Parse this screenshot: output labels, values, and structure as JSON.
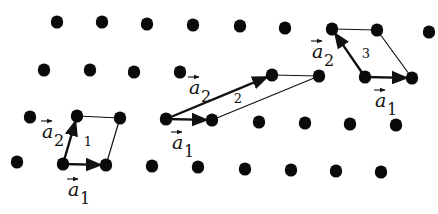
{
  "diagram": {
    "colors": {
      "dot": "#0a0a0a",
      "line": "#111111",
      "background": "#ffffff"
    },
    "lattice_points": [
      [
        57,
        22
      ],
      [
        102,
        22
      ],
      [
        147,
        24
      ],
      [
        193,
        25
      ],
      [
        240,
        26
      ],
      [
        285,
        28
      ],
      [
        332,
        29
      ],
      [
        377,
        30
      ],
      [
        429,
        32
      ],
      [
        44,
        70
      ],
      [
        90,
        70
      ],
      [
        134,
        72
      ],
      [
        180,
        72
      ],
      [
        272,
        75
      ],
      [
        319,
        76
      ],
      [
        365,
        77
      ],
      [
        412,
        78
      ],
      [
        30,
        117
      ],
      [
        77,
        116
      ],
      [
        120,
        118
      ],
      [
        166,
        119
      ],
      [
        212,
        120
      ],
      [
        259,
        122
      ],
      [
        305,
        123
      ],
      [
        350,
        124
      ],
      [
        396,
        125
      ],
      [
        17,
        162
      ],
      [
        63,
        164
      ],
      [
        106,
        165
      ],
      [
        152,
        166
      ],
      [
        198,
        167
      ],
      [
        245,
        169
      ],
      [
        291,
        170
      ],
      [
        336,
        171
      ],
      [
        381,
        172
      ]
    ],
    "cells": [
      {
        "id": "1",
        "label": "1",
        "origin": [
          63,
          164
        ],
        "a1_tip": [
          106,
          165
        ],
        "a2_tip": [
          77,
          116
        ],
        "far": [
          120,
          118
        ],
        "label_pos": [
          88,
          146
        ],
        "a1_label": {
          "text": "a",
          "sub": "1",
          "pos": [
            68,
            196
          ]
        },
        "a2_label": {
          "text": "a",
          "sub": "2",
          "pos": [
            42,
            138
          ]
        }
      },
      {
        "id": "2",
        "label": "2",
        "origin": [
          166,
          119
        ],
        "a1_tip": [
          212,
          120
        ],
        "a2_tip": [
          272,
          75
        ],
        "far": [
          319,
          76
        ],
        "label_pos": [
          238,
          103
        ],
        "a1_label": {
          "text": "a",
          "sub": "1",
          "pos": [
            172,
            149
          ]
        },
        "a2_label": {
          "text": "a",
          "sub": "2",
          "pos": [
            189,
            94
          ]
        }
      },
      {
        "id": "3",
        "label": "3",
        "origin": [
          365,
          77
        ],
        "a1_tip": [
          412,
          78
        ],
        "a2_tip": [
          332,
          29
        ],
        "far": [
          377,
          30
        ],
        "label_pos": [
          366,
          58
        ],
        "a1_label": {
          "text": "a",
          "sub": "1",
          "pos": [
            375,
            107
          ]
        },
        "a2_label": {
          "text": "a",
          "sub": "2",
          "pos": [
            312,
            58
          ]
        }
      }
    ]
  }
}
